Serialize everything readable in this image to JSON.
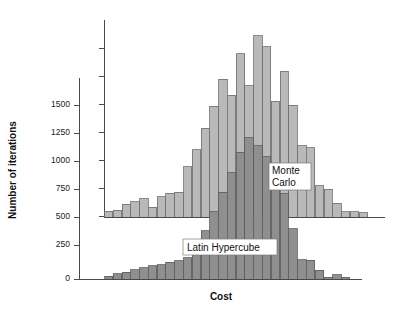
{
  "figure": {
    "background_color": "#ffffff",
    "axis_color": "#4a4a4a"
  },
  "labels": {
    "ylabel": "Number of iterations",
    "xlabel": "Cost",
    "series_monte_carlo_line1": "Monte",
    "series_monte_carlo_line2": "Carlo",
    "series_latin_hypercube": "Latin Hypercube"
  },
  "yticks": {
    "t0": "0",
    "t1": "250",
    "t2": "500",
    "t3": "750",
    "t4": "1000",
    "t5": "1250",
    "t6": "1500"
  },
  "chart_data": {
    "type": "bar",
    "title": "",
    "subtitle": "",
    "xlabel": "Cost",
    "ylabel": "Number of iterations",
    "grid": false,
    "legend_position": "inline-annotation",
    "primary_axis": {
      "name": "Number of iterations",
      "ticks": [
        0,
        250,
        500,
        750,
        1000,
        1250,
        1500
      ],
      "ylim": [
        0,
        1750
      ],
      "tick_labels_shown": true
    },
    "secondary_axis": {
      "name": "Monte Carlo axis",
      "baseline_at_primary_value": 500,
      "ticks_shown": true,
      "tick_labels_shown": false,
      "tick_count": 7
    },
    "categories": [
      "b1",
      "b2",
      "b3",
      "b4",
      "b5",
      "b6",
      "b7",
      "b8",
      "b9",
      "b10",
      "b11",
      "b12",
      "b13",
      "b14",
      "b15",
      "b16",
      "b17",
      "b18",
      "b19",
      "b20",
      "b21",
      "b22",
      "b23",
      "b24",
      "b25",
      "b26",
      "b27",
      "b28",
      "b29",
      "b30",
      "b31",
      "b32"
    ],
    "series": [
      {
        "name": "Monte Carlo",
        "color": "#b9b9b9",
        "edge_color": "#6e6e6e",
        "baseline": 500,
        "values": [
          540,
          545,
          585,
          600,
          620,
          565,
          630,
          655,
          660,
          820,
          930,
          1065,
          1205,
          1375,
          1275,
          1535,
          1335,
          1650,
          1580,
          1235,
          1425,
          1210,
          955,
          940,
          700,
          680,
          590,
          535,
          535,
          530,
          500,
          500
        ]
      },
      {
        "name": "Latin Hypercube",
        "color": "#8f8f8f",
        "edge_color": "#5c5c5c",
        "baseline": 0,
        "values": [
          25,
          45,
          60,
          80,
          95,
          110,
          120,
          140,
          150,
          175,
          300,
          395,
          545,
          705,
          860,
          1025,
          1145,
          1080,
          990,
          915,
          690,
          410,
          160,
          155,
          75,
          20,
          40,
          20,
          0,
          0,
          0,
          0
        ]
      }
    ]
  }
}
